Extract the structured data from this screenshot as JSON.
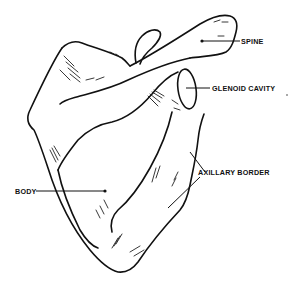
{
  "figure": {
    "labels": {
      "spine": "SPINE",
      "glenoid_cavity": "GLENOID CAVITY",
      "axillary_border": "AXILLARY BORDER",
      "body": "BODY"
    }
  }
}
